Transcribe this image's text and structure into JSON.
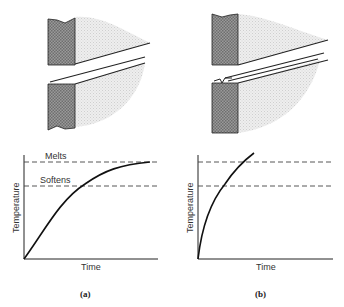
{
  "panels": [
    {
      "id": "a",
      "caption": "(a)",
      "graph": {
        "xlabel": "Time",
        "ylabel": "Temperature",
        "levels": [
          {
            "name": "melts",
            "label": "Melts"
          },
          {
            "name": "softens",
            "label": "Softens"
          }
        ]
      }
    },
    {
      "id": "b",
      "caption": "(b)",
      "graph": {
        "xlabel": "Time",
        "ylabel": "Temperature",
        "levels": [
          {
            "name": "melts",
            "label": ""
          },
          {
            "name": "softens",
            "label": ""
          }
        ]
      }
    }
  ],
  "colors": {
    "ink": "#222222",
    "plate_fill": "#8c8c8c",
    "heat_zone": "#d9d9d9",
    "dash": "#444444"
  }
}
